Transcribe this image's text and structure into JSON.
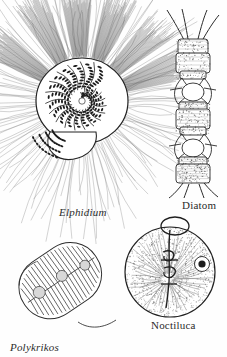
{
  "plate": {
    "kind": "scientific-illustration-plate",
    "medium": "pen-and-ink line engraving",
    "background_color": "#fefefe",
    "ink_color": "#2b2b2b",
    "figure_count": 4
  },
  "figures": [
    {
      "id": "elphidium",
      "label": "Elphidium",
      "label_style": "italic",
      "organism_group": "foraminiferan",
      "description": "planispiral multi-chambered test with dense radiating pseudopodia",
      "chamber_count": 22,
      "ray_count": 150
    },
    {
      "id": "diatom",
      "label": "Diatom",
      "label_style": "roman",
      "organism_group": "diatom",
      "description": "chain of three box-shaped frustules joined by linking spines",
      "cell_count": 3,
      "spine_count": 12
    },
    {
      "id": "polykrikos",
      "label": "Polykrikos",
      "label_style": "italic",
      "organism_group": "dinoflagellate",
      "description": "elongate pseudocolony with transverse girdle bands and trailing flagellum",
      "band_count": 18,
      "nematocyst_count": 3
    },
    {
      "id": "noctiluca",
      "label": "Noctiluca",
      "label_style": "roman",
      "organism_group": "dinoflagellate",
      "description": "spherical cell with radiating cytoplasmic strands, central tentacle, nucleus and apical loop",
      "strand_count": 60
    }
  ]
}
